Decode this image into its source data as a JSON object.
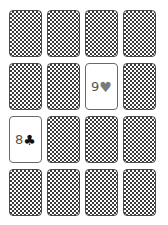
{
  "game": {
    "name": "memory-match",
    "rows": 4,
    "cols": 4
  },
  "colors": {
    "background": "#ffffff",
    "card_back_pattern": "#3a3a3a",
    "card_border": "#4a4a4a",
    "rank_color": "#555555"
  },
  "cards": [
    {
      "row": 0,
      "col": 0,
      "state": "face-down"
    },
    {
      "row": 0,
      "col": 1,
      "state": "face-down"
    },
    {
      "row": 0,
      "col": 2,
      "state": "face-down"
    },
    {
      "row": 0,
      "col": 3,
      "state": "face-down"
    },
    {
      "row": 1,
      "col": 0,
      "state": "face-down"
    },
    {
      "row": 1,
      "col": 1,
      "state": "face-down"
    },
    {
      "row": 1,
      "col": 2,
      "state": "face-up",
      "rank": "9",
      "suit": "♥",
      "suit_name": "hearts",
      "suit_color": "#7a7a7a"
    },
    {
      "row": 1,
      "col": 3,
      "state": "face-down"
    },
    {
      "row": 2,
      "col": 0,
      "state": "face-up",
      "rank": "8",
      "suit": "♣",
      "suit_name": "clubs",
      "suit_color": "#111111"
    },
    {
      "row": 2,
      "col": 1,
      "state": "face-down"
    },
    {
      "row": 2,
      "col": 2,
      "state": "face-down"
    },
    {
      "row": 2,
      "col": 3,
      "state": "face-down"
    },
    {
      "row": 3,
      "col": 0,
      "state": "face-down"
    },
    {
      "row": 3,
      "col": 1,
      "state": "face-down"
    },
    {
      "row": 3,
      "col": 2,
      "state": "face-down"
    },
    {
      "row": 3,
      "col": 3,
      "state": "face-down"
    }
  ]
}
